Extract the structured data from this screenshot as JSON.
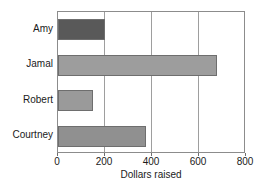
{
  "chart_data": {
    "type": "bar",
    "orientation": "horizontal",
    "title": "",
    "xlabel": "Dollars raised",
    "ylabel": "",
    "categories": [
      "Amy",
      "Jamal",
      "Robert",
      "Courtney"
    ],
    "values": [
      200,
      675,
      150,
      375
    ],
    "bar_colors": [
      "#595959",
      "#9d9d9d",
      "#9a9a9a",
      "#909090"
    ],
    "xlim": [
      0,
      800
    ],
    "xticks": [
      0,
      200,
      400,
      600,
      800
    ],
    "gridlines": [
      200,
      400,
      600
    ],
    "grid": true,
    "legend": null,
    "frame_color": "#8c8c8c",
    "bar_edge_color": "#6e6e6e",
    "background": "#ffffff"
  }
}
